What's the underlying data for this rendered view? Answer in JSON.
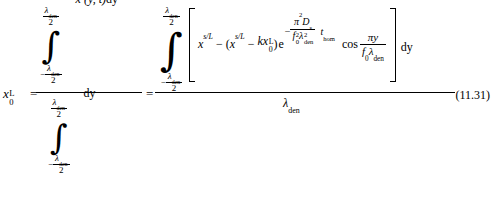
{
  "document": {
    "type": "equation",
    "equation_number": "(11.31)",
    "description": "Averaged surface concentration equation"
  },
  "symbols": {
    "x": "x",
    "lambda": "λ",
    "den": "den",
    "two": "2",
    "minus": "−",
    "equals": "=",
    "pi": "π",
    "integral": "∫",
    "y": "y",
    "t": "t",
    "dy": "dy",
    "L": "L",
    "s": "s",
    "k": "k",
    "e": "e",
    "cos": "cos",
    "D": "D",
    "f": "f",
    "zero": "0",
    "hom": "hom",
    "sub_s": "s",
    "slash": "/",
    "sq": "2",
    "lparen": "(",
    "rparen": ")"
  },
  "lhs": {
    "base": "x",
    "sub": "0",
    "sup": "L",
    "equals": "="
  },
  "first_fraction": {
    "numerator": {
      "integral_upper": {
        "numerator": "λ",
        "numerator_sub": "den",
        "denominator": "2"
      },
      "integral_lower": {
        "sign": "−",
        "numerator": "λ",
        "numerator_sub": "den",
        "denominator": "2"
      },
      "integrand": {
        "base": "x",
        "sup": "s",
        "args": "(y, t)",
        "differential": "dy"
      }
    },
    "denominator": {
      "integral_upper": {
        "numerator": "λ",
        "numerator_sub": "den",
        "denominator": "2"
      },
      "integral_lower": {
        "sign": "−",
        "numerator": "λ",
        "numerator_sub": "den",
        "denominator": "2"
      },
      "integrand": {
        "differential": "dy"
      }
    }
  },
  "second_equals": "=",
  "second_fraction": {
    "numerator": {
      "integral_upper": {
        "numerator": "λ",
        "numerator_sub": "den",
        "denominator": "2"
      },
      "integral_lower": {
        "sign": "−",
        "numerator": "λ",
        "numerator_sub": "den",
        "denominator": "2"
      },
      "bracket_open": "[",
      "bracket_close": "]",
      "term1": {
        "base": "x",
        "sup": "s/L"
      },
      "operator1": "−",
      "paren_open": "(",
      "term2": {
        "base": "x",
        "sup": "s/L"
      },
      "operator2": "−",
      "term3": {
        "coefficient": "k",
        "base": "x",
        "sub": "0",
        "sup": "L"
      },
      "paren_close": ")",
      "exp_base": "e",
      "exponent": {
        "sign": "−",
        "numerator": {
          "pi": "π",
          "pi_sup": "2",
          "D": "D",
          "D_sub": "s"
        },
        "denominator": {
          "f": "f",
          "f_sub": "0",
          "f_sup": "2",
          "lambda": "λ",
          "lambda_sub": "den",
          "lambda_sup": "2"
        },
        "trailing": {
          "t": "t",
          "t_sub": "hom"
        }
      },
      "cos_term": {
        "function": "cos",
        "numerator": {
          "pi": "π",
          "y": "y"
        },
        "denominator": {
          "f": "f",
          "f_sub": "0",
          "lambda": "λ",
          "lambda_sub": "den"
        }
      },
      "differential": "dy"
    },
    "denominator": {
      "lambda": "λ",
      "lambda_sub": "den"
    }
  }
}
